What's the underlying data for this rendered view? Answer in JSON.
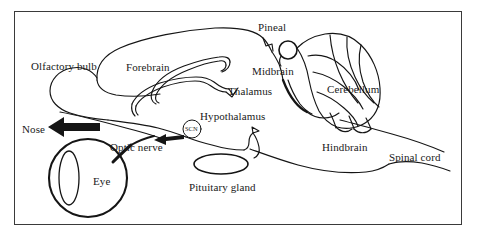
{
  "figure": {
    "type": "anatomical-diagram",
    "frame": {
      "border_color": "#3a3a3a",
      "background": "#ffffff"
    },
    "ink_color": "#151515",
    "labels": [
      {
        "id": "olfactory-bulb",
        "text": "Olfactory bulb",
        "x": 31,
        "y": 61
      },
      {
        "id": "forebrain",
        "text": "Forebrain",
        "x": 126,
        "y": 62
      },
      {
        "id": "pineal",
        "text": "Pineal",
        "x": 258,
        "y": 22
      },
      {
        "id": "midbrain",
        "text": "Midbrain",
        "x": 252,
        "y": 66
      },
      {
        "id": "thalamus",
        "text": "Thalamus",
        "x": 228,
        "y": 86
      },
      {
        "id": "cerebellum",
        "text": "Cerebellum",
        "x": 327,
        "y": 84
      },
      {
        "id": "hypothalamus",
        "text": "Hypothalamus",
        "x": 200,
        "y": 111
      },
      {
        "id": "nose",
        "text": "Nose",
        "x": 22,
        "y": 124
      },
      {
        "id": "optic-nerve",
        "text": "Optic nerve",
        "x": 110,
        "y": 142
      },
      {
        "id": "eye",
        "text": "Eye",
        "x": 93,
        "y": 176
      },
      {
        "id": "pituitary-gland",
        "text": "Pituitary gland",
        "x": 189,
        "y": 182
      },
      {
        "id": "hindbrain",
        "text": "Hindbrain",
        "x": 322,
        "y": 142
      },
      {
        "id": "spinal-cord",
        "text": "Spinal cord",
        "x": 389,
        "y": 152
      },
      {
        "id": "scn",
        "text": "SCN",
        "x": 185,
        "y": 126
      }
    ],
    "structures": [
      {
        "id": "pineal-gland",
        "shape": "circle",
        "cx": 288,
        "cy": 50,
        "r": 9
      },
      {
        "id": "pituitary-gland-body",
        "shape": "ellipse",
        "cx": 221,
        "cy": 164,
        "rx": 27,
        "ry": 10
      },
      {
        "id": "scn-nucleus",
        "shape": "circle",
        "cx": 192,
        "cy": 129,
        "r": 9
      },
      {
        "id": "eyeball",
        "shape": "circle",
        "cx": 88,
        "cy": 178,
        "r": 39
      },
      {
        "id": "lens",
        "shape": "ellipse",
        "cx": 69,
        "cy": 178,
        "rx": 10,
        "ry": 27
      },
      {
        "id": "nose-arrow",
        "shape": "arrow",
        "direction": "left"
      },
      {
        "id": "optic-nerve-arrow",
        "shape": "arrow",
        "direction": "left"
      }
    ]
  }
}
